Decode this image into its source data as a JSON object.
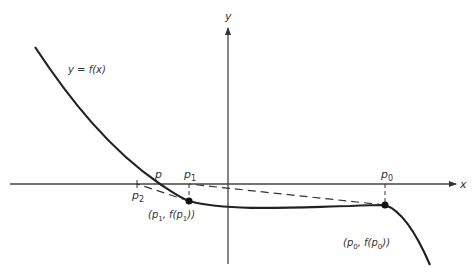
{
  "figure": {
    "axes": {
      "x_label": "x",
      "y_label": "y"
    },
    "curve_label": "y = f(x)",
    "points": {
      "p": "p",
      "p0": "p",
      "p0_sub": "0",
      "p1": "p",
      "p1_sub": "1",
      "p2": "p",
      "p2_sub": "2"
    },
    "annotations": {
      "point_p1_prefix": "(p",
      "point_p1_sub": "1",
      "point_p1_mid": ", f(p",
      "point_p1_sub2": "1",
      "point_p1_suffix": "))",
      "point_p0_prefix": "(p",
      "point_p0_sub": "0",
      "point_p0_mid": ", f(p",
      "point_p0_sub2": "0",
      "point_p0_suffix": "))"
    },
    "colors": {
      "line": "#222222",
      "axis": "#444444",
      "text": "#333333",
      "background": "#ffffff"
    }
  }
}
